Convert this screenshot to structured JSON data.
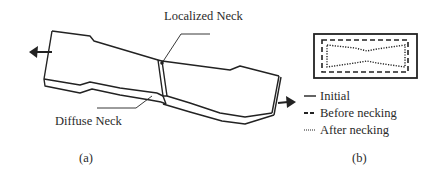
{
  "panel_a": {
    "caption": "(a)",
    "labels": {
      "localized_neck": "Localized Neck",
      "diffuse_neck": "Diffuse Neck"
    }
  },
  "panel_b": {
    "caption": "(b)",
    "legend": [
      {
        "style": "solid",
        "label": "Initial"
      },
      {
        "style": "dashed",
        "label": "Before necking"
      },
      {
        "style": "dotted",
        "label": "After necking"
      }
    ]
  },
  "colors": {
    "line": "#222222",
    "background": "#ffffff"
  }
}
